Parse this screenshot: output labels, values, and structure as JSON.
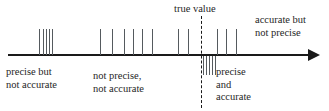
{
  "figure": {
    "title": "",
    "axis": {
      "orientation": "horizontal",
      "arrow_direction": "right",
      "color": "#1a1a1a"
    },
    "true_value_line": {
      "style": "dashed",
      "color": "#1a1a1a",
      "x": 201
    }
  },
  "labels": {
    "true_value": "true value",
    "accurate_but_not_precise_line1": "accurate but",
    "accurate_but_not_precise_line2": "not precise",
    "precise_but_not_accurate_line1": "precise but",
    "precise_but_not_accurate_line2": "not accurate",
    "not_precise_not_accurate_line1": "not precise,",
    "not_precise_not_accurate_line2": "not accurate",
    "precise_and_accurate_line1": "precise",
    "precise_and_accurate_line2": "and",
    "precise_and_accurate_line3": "accurate"
  },
  "chart_data": {
    "type": "scatter",
    "title": "",
    "xlabel": "",
    "ylabel": "",
    "grid": false,
    "legend_position": "none",
    "true_value": 201,
    "groups": [
      {
        "name": "precise but not accurate",
        "side": "above",
        "label_position": "below-axis-left",
        "x": [
          39,
          43,
          46,
          49,
          52
        ],
        "tick_top": 29,
        "tick_height": 26,
        "color": "#555a5e"
      },
      {
        "name": "not precise, not accurate",
        "side": "above",
        "label_position": "below-axis-center",
        "x": [
          100,
          112,
          124,
          133,
          142,
          152
        ],
        "tick_top": 29,
        "tick_height": 26,
        "color": "#555a5e"
      },
      {
        "name": "scattered near true value (above)",
        "side": "above",
        "label_position": "none",
        "x": [
          178,
          188
        ],
        "tick_top": 29,
        "tick_height": 26,
        "color": "#555a5e"
      },
      {
        "name": "accurate but not precise",
        "side": "above",
        "label_position": "above-axis-right",
        "x": [
          217,
          226,
          236
        ],
        "tick_top": 29,
        "tick_height": 26,
        "color": "#555a5e"
      },
      {
        "name": "precise and accurate",
        "side": "below",
        "label_position": "below-axis-right",
        "x": [
          203,
          206,
          209,
          212,
          215
        ],
        "tick_top": 56,
        "tick_height": 19,
        "color": "#555a5e"
      }
    ]
  }
}
